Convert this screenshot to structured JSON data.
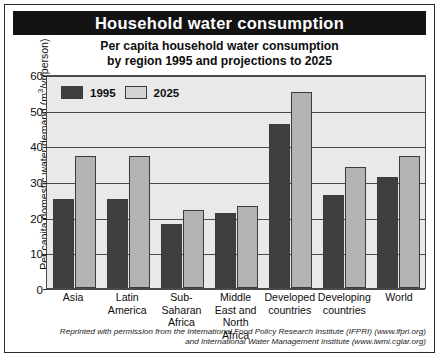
{
  "header": {
    "title": "Household water consumption",
    "subtitle_line1": "Per capita household water consumption",
    "subtitle_line2": "by region 1995 and projections to 2025"
  },
  "credit": {
    "line1": "Reprinted with permission from the International Food Policy Research Institute (IFPRI) (www.ifpri.org)",
    "line2": "and International Water Management Institute (www.iwmi.cgiar.org)"
  },
  "axis": {
    "ylabel_main": "Per capita domestic water demand (m",
    "ylabel_sup": "3",
    "ylabel_tail": "/yr/person)",
    "yticks": [
      "60",
      "50",
      "40",
      "30",
      "20",
      "10",
      "0"
    ]
  },
  "legend": {
    "items": [
      {
        "label": "1995",
        "color": "#3f3f3f"
      },
      {
        "label": "2025",
        "color": "#d2d2d2"
      }
    ]
  },
  "chart_data": {
    "type": "bar",
    "title": "Per capita household water consumption by region 1995 and projections to 2025",
    "xlabel": "",
    "ylabel": "Per capita domestic water demand (m3/yr/person)",
    "ylim": [
      0,
      60
    ],
    "ytick_step": 10,
    "grid": true,
    "legend_position": "top-left-inside",
    "categories": [
      "Asia",
      "Latin America",
      "Sub-Saharan Africa",
      "Middle East and North Africa",
      "Developed countries",
      "Developing countries",
      "World"
    ],
    "category_lines": [
      [
        "Asia"
      ],
      [
        "Latin",
        "America"
      ],
      [
        "Sub-Saharan",
        "Africa"
      ],
      [
        "Middle",
        "East and",
        "North Africa"
      ],
      [
        "Developed",
        "countries"
      ],
      [
        "Developing",
        "countries"
      ],
      [
        "World"
      ]
    ],
    "series": [
      {
        "name": "1995",
        "color": "#3f3f3f",
        "values": [
          25,
          25,
          18,
          21,
          46,
          26,
          31
        ]
      },
      {
        "name": "2025",
        "color": "#b4b4b4",
        "values": [
          37,
          37,
          22,
          23,
          55,
          34,
          37
        ]
      }
    ]
  }
}
